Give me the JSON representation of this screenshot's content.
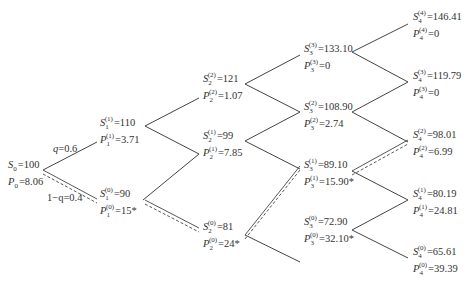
{
  "diagram": {
    "type": "binomial-tree",
    "probabilities": {
      "up": {
        "symbol": "q",
        "value": "0.6"
      },
      "down": {
        "symbol": "1−q",
        "value": "0.4"
      }
    },
    "nodes": [
      {
        "id": "n0",
        "step": 0,
        "state": "",
        "s_label": "S",
        "s_sub": "0",
        "s_value": "100",
        "p_label": "P",
        "p_sub": "0",
        "p_value": "8.06",
        "star": false
      },
      {
        "id": "n1_1",
        "step": 1,
        "state": "1",
        "s_label": "S",
        "s_sub": "1",
        "s_value": "110",
        "p_label": "P",
        "p_sub": "1",
        "p_value": "3.71",
        "star": false
      },
      {
        "id": "n1_0",
        "step": 1,
        "state": "0",
        "s_label": "S",
        "s_sub": "1",
        "s_value": "90",
        "p_label": "P",
        "p_sub": "1",
        "p_value": "15",
        "star": true
      },
      {
        "id": "n2_2",
        "step": 2,
        "state": "2",
        "s_label": "S",
        "s_sub": "2",
        "s_value": "121",
        "p_label": "P",
        "p_sub": "2",
        "p_value": "1.07",
        "star": false
      },
      {
        "id": "n2_1",
        "step": 2,
        "state": "1",
        "s_label": "S",
        "s_sub": "2",
        "s_value": "99",
        "p_label": "P",
        "p_sub": "2",
        "p_value": "7.85",
        "star": false
      },
      {
        "id": "n2_0",
        "step": 2,
        "state": "0",
        "s_label": "S",
        "s_sub": "2",
        "s_value": "81",
        "p_label": "P",
        "p_sub": "2",
        "p_value": "24",
        "star": true
      },
      {
        "id": "n3_3",
        "step": 3,
        "state": "3",
        "s_label": "S",
        "s_sub": "3",
        "s_value": "133.10",
        "p_label": "P",
        "p_sub": "3",
        "p_value": "0",
        "star": false
      },
      {
        "id": "n3_2",
        "step": 3,
        "state": "2",
        "s_label": "S",
        "s_sub": "3",
        "s_value": "108.90",
        "p_label": "P",
        "p_sub": "3",
        "p_value": "2.74",
        "star": false
      },
      {
        "id": "n3_1",
        "step": 3,
        "state": "1",
        "s_label": "S",
        "s_sub": "3",
        "s_value": "89.10",
        "p_label": "P",
        "p_sub": "3",
        "p_value": "15.90",
        "star": true
      },
      {
        "id": "n3_0",
        "step": 3,
        "state": "0",
        "s_label": "S",
        "s_sub": "3",
        "s_value": "72.90",
        "p_label": "P",
        "p_sub": "3",
        "p_value": "32.10",
        "star": true
      },
      {
        "id": "n4_4",
        "step": 4,
        "state": "4",
        "s_label": "S",
        "s_sub": "4",
        "s_value": "146.41",
        "p_label": "P",
        "p_sub": "4",
        "p_value": "0",
        "star": false
      },
      {
        "id": "n4_3",
        "step": 4,
        "state": "3",
        "s_label": "S",
        "s_sub": "4",
        "s_value": "119.79",
        "p_label": "P",
        "p_sub": "4",
        "p_value": "0",
        "star": false
      },
      {
        "id": "n4_2",
        "step": 4,
        "state": "2",
        "s_label": "S",
        "s_sub": "4",
        "s_value": "98.01",
        "p_label": "P",
        "p_sub": "4",
        "p_value": "6.99",
        "star": false
      },
      {
        "id": "n4_1",
        "step": 4,
        "state": "1",
        "s_label": "S",
        "s_sub": "4",
        "s_value": "80.19",
        "p_label": "P",
        "p_sub": "4",
        "p_value": "24.81",
        "star": false
      },
      {
        "id": "n4_0",
        "step": 4,
        "state": "0",
        "s_label": "S",
        "s_sub": "4",
        "s_value": "65.61",
        "p_label": "P",
        "p_sub": "4",
        "p_value": "39.39",
        "star": false
      }
    ],
    "star_symbol": "*",
    "equals": "="
  }
}
